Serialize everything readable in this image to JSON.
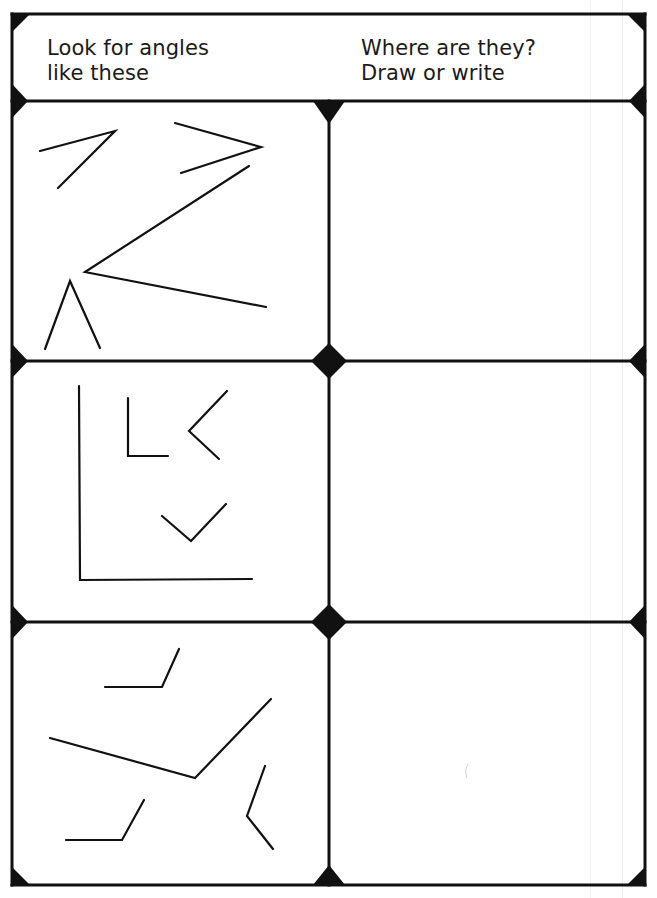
{
  "worksheet": {
    "header": {
      "left_line1": "Look for angles",
      "left_line2": "like these",
      "right_line1": "Where are they?",
      "right_line2": "Draw or write"
    },
    "rows": [
      {
        "name": "row-1",
        "angles": "acute angles (four examples)",
        "answer": ""
      },
      {
        "name": "row-2",
        "angles": "right angles (four examples)",
        "answer": ""
      },
      {
        "name": "row-3",
        "angles": "obtuse angles (four examples)",
        "answer": ""
      }
    ],
    "colors": {
      "ink": "#111111",
      "paper": "#ffffff"
    }
  }
}
